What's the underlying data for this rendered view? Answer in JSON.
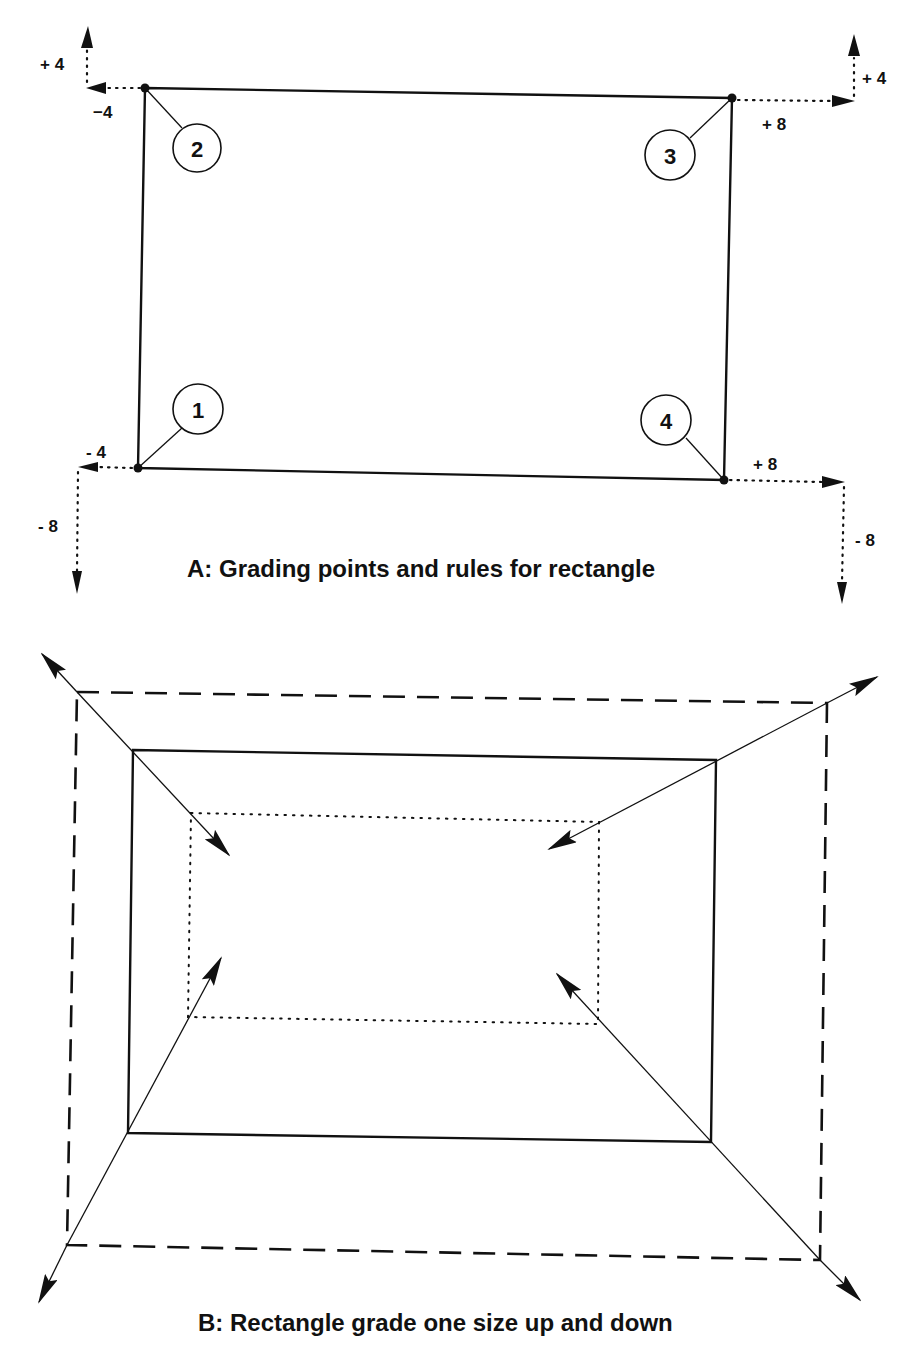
{
  "diagram_a": {
    "caption": "A: Grading points and rules for rectangle",
    "points": [
      {
        "id": "1",
        "label": "1",
        "x_rule": "- 4",
        "y_rule": "- 8"
      },
      {
        "id": "2",
        "label": "2",
        "x_rule": "−4",
        "y_rule": "+ 4"
      },
      {
        "id": "3",
        "label": "3",
        "x_rule": "+ 8",
        "y_rule": "+ 4"
      },
      {
        "id": "4",
        "label": "4",
        "x_rule": "+ 8",
        "y_rule": "- 8"
      }
    ]
  },
  "diagram_b": {
    "caption": "B: Rectangle grade one size up and down",
    "outlines": [
      {
        "name": "base-size",
        "style": "solid"
      },
      {
        "name": "one-size-up",
        "style": "dashed"
      },
      {
        "name": "one-size-down",
        "style": "dotted"
      }
    ]
  },
  "colors": {
    "ink": "#111111",
    "background": "#ffffff"
  }
}
